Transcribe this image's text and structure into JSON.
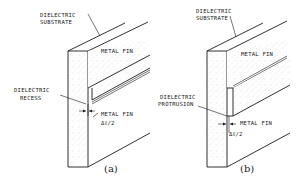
{
  "figure": {
    "panels": [
      {
        "id": "a",
        "caption": "(a)",
        "labels": {
          "substrate": [
            "DIELECTRIC",
            "SUBSTRATE"
          ],
          "metal_fin_top": "METAL FIN",
          "feature": [
            "DIELECTRIC",
            "RECESS"
          ],
          "metal_fin_bottom": "METAL FIN",
          "delta": "Δℓ/2"
        }
      },
      {
        "id": "b",
        "caption": "(b)",
        "labels": {
          "substrate": [
            "DIELECTRIC",
            "SUBSTRATE"
          ],
          "metal_fin_top": "METAL FIN",
          "feature": [
            "DIELECTRIC",
            "PROTRUSION"
          ],
          "metal_fin_bottom": "METAL FIN",
          "delta": "Δℓ/2"
        }
      }
    ],
    "colors": {
      "ink": "#1a1a1a",
      "background": "#ffffff"
    }
  }
}
